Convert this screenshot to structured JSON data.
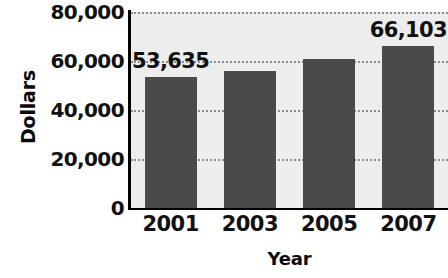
{
  "chart_data": {
    "type": "bar",
    "title": "",
    "subtitle": "",
    "xlabel": "Year",
    "ylabel": "Dollars",
    "categories": [
      "2001",
      "2003",
      "2005",
      "2007"
    ],
    "values": [
      53635,
      56000,
      61000,
      66103
    ],
    "point_labels": [
      "53,635",
      "",
      "",
      "66,103"
    ],
    "series": [
      {
        "name": "Dollars",
        "values": [
          53635,
          56000,
          61000,
          66103
        ]
      }
    ],
    "ylim": [
      0,
      80000
    ],
    "ytick_values": [
      0,
      20000,
      40000,
      60000,
      80000
    ],
    "ytick_labels": [
      "0",
      "20,000",
      "40,000",
      "60,000",
      "80,000"
    ],
    "xtick_labels": [
      "2001",
      "2003",
      "2005",
      "2007"
    ],
    "grid": true,
    "grid_style": "dotted-horizontal",
    "legend": false,
    "legend_position": "none",
    "annotations": [
      {
        "category": "2001",
        "text": "53,635"
      },
      {
        "category": "2007",
        "text": "66,103"
      }
    ],
    "colors": {
      "bar_fill": "#4a4a4a",
      "plot_background": "#ededed",
      "page_background": "#ffffff",
      "axis_line": "#000000",
      "gridline": "#8d8d8d",
      "text": "#111111"
    }
  }
}
